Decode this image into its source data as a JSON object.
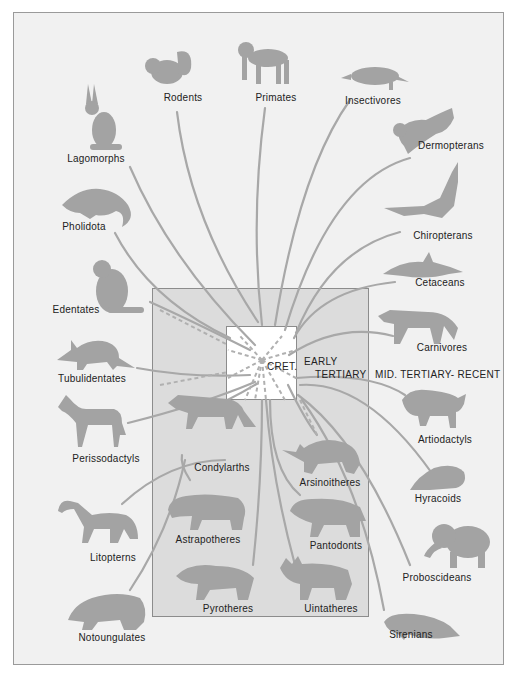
{
  "diagram": {
    "colors": {
      "background": "#f1f1f1",
      "era_box": "#dcdcdc",
      "center_box": "#ffffff",
      "lines": "#a8a8a8",
      "silhouette": "#a3a3a3",
      "border": "#8c8c8c"
    },
    "eras": {
      "cretaceous": "CRET.",
      "early_tertiary_line1": "EARLY",
      "early_tertiary_line2": "TERTIARY",
      "mid_tertiary_recent": "MID. TERTIARY- RECENT"
    },
    "groups": {
      "rodents": "Rodents",
      "primates": "Primates",
      "insectivores": "Insectivores",
      "lagomorphs": "Lagomorphs",
      "dermopterans": "Dermopterans",
      "pholidota": "Pholidota",
      "chiropterans": "Chiropterans",
      "edentates": "Edentates",
      "cetaceans": "Cetaceans",
      "carnivores": "Carnivores",
      "tubulidentates": "Tubulidentates",
      "artiodactyls": "Artiodactyls",
      "perissodactyls": "Perissodactyls",
      "condylarths": "Condylarths",
      "arsinoitheres": "Arsinoitheres",
      "hyracoids": "Hyracoids",
      "litopterns": "Litopterns",
      "astrapotheres": "Astrapotheres",
      "pantodonts": "Pantodonts",
      "proboscideans": "Proboscideans",
      "pyrotheres": "Pyrotheres",
      "uintatheres": "Uintatheres",
      "notoungulates": "Notoungulates",
      "sirenians": "Sirenians"
    },
    "extinct_groups_in_box": [
      "Condylarths",
      "Arsinoitheres",
      "Astrapotheres",
      "Pantodonts",
      "Pyrotheres",
      "Uintatheres"
    ],
    "origin": "CRET."
  }
}
